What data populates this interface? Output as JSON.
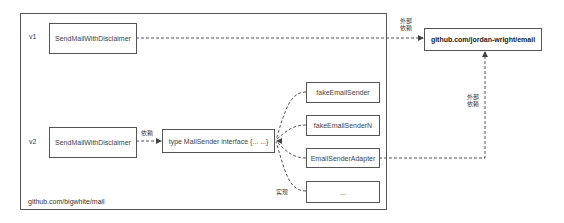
{
  "container": {
    "label": "github.com/bigwhite/mail"
  },
  "versions": {
    "v1": "v1",
    "v2": "v2"
  },
  "nodes": {
    "v1_sender": "SendMailWithDisclaimer",
    "v2_sender": "SendMailWithDisclaimer",
    "interface": "type MailSender interface {... ...}",
    "impl_1": "fakeEmailSender",
    "impl_2": "fakeEmailSenderN",
    "impl_3": "EmailSenderAdapter",
    "impl_4": "...",
    "external": "github.com/jordan-wright/email"
  },
  "edge_labels": {
    "external_dep_top": "外部\n依赖",
    "external_dep_side": "外部\n依赖",
    "depends": "依赖",
    "implements": "实现"
  },
  "colors": {
    "stroke": "#555555",
    "text": "#333333",
    "background": "#ffffff"
  }
}
